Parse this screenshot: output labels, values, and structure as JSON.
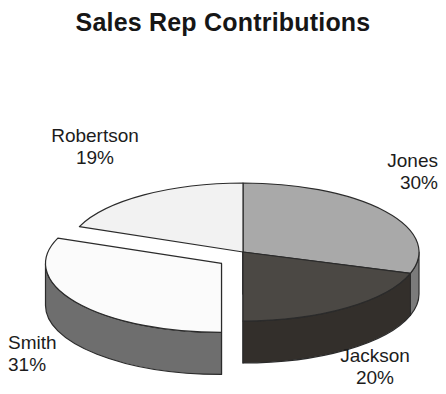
{
  "chart_data": {
    "type": "pie",
    "title": "Sales Rep Contributions",
    "xlabel": "",
    "ylabel": "",
    "legend_position": "none",
    "grid": false,
    "three_d": true,
    "exploded_slice": "Smith",
    "categories": [
      "Jones",
      "Jackson",
      "Smith",
      "Robertson"
    ],
    "values": [
      30,
      20,
      31,
      19
    ],
    "labels": [
      "Jones 30%",
      "Jackson 20%",
      "Smith 31%",
      "Robertson 19%"
    ],
    "slices": [
      {
        "name": "Jones",
        "percent": 30,
        "percent_label": "30%",
        "top_color": "#a9a9a9",
        "side_color": "#7b7b7b",
        "start_angle": 0,
        "end_angle": 108,
        "exploded": false
      },
      {
        "name": "Jackson",
        "percent": 20,
        "percent_label": "20%",
        "top_color": "#4b4844",
        "side_color": "#332f2b",
        "start_angle": 108,
        "end_angle": 180,
        "exploded": false
      },
      {
        "name": "Smith",
        "percent": 31,
        "percent_label": "31%",
        "top_color": "#fbfbfb",
        "side_color": "#6e6e6e",
        "start_angle": 180,
        "end_angle": 291.6,
        "exploded": true
      },
      {
        "name": "Robertson",
        "percent": 19,
        "percent_label": "19%",
        "top_color": "#f2f2f2",
        "side_color": "#6a6a6a",
        "start_angle": 291.6,
        "end_angle": 360,
        "exploded": false
      }
    ]
  },
  "title": {
    "text": "Sales Rep Contributions"
  },
  "labels": {
    "robertson": {
      "name": "Robertson",
      "percent": "19%"
    },
    "jones": {
      "name": "Jones",
      "percent": "30%"
    },
    "smith": {
      "name": "Smith",
      "percent": "31%"
    },
    "jackson": {
      "name": "Jackson",
      "percent": "20%"
    }
  },
  "colors": {
    "background": "#ffffff",
    "text": "#1c1c1c",
    "outline": "#2b2b2b"
  }
}
